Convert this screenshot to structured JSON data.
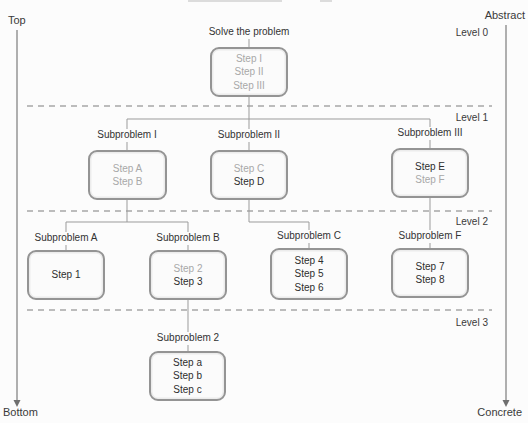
{
  "figure": {
    "width": 528,
    "height": 423,
    "bg": "#fcfcfc"
  },
  "corners": {
    "top_left": "Top",
    "bottom_left": "Bottom",
    "top_right": "Abstract",
    "bottom_right": "Concrete"
  },
  "axes": {
    "left": {
      "x": 17,
      "y1": 30,
      "y2": 401
    },
    "right": {
      "x": 506,
      "y1": 25,
      "y2": 401
    }
  },
  "dashed_lines": [
    {
      "y": 106,
      "x1": 27,
      "x2": 492
    },
    {
      "y": 211,
      "x1": 27,
      "x2": 492
    },
    {
      "y": 310,
      "x1": 27,
      "x2": 492
    }
  ],
  "level_labels": [
    {
      "text": "Level 0",
      "right": 488,
      "top": 27
    },
    {
      "text": "Level 1",
      "right": 488,
      "top": 112
    },
    {
      "text": "Level 2",
      "right": 488,
      "top": 216
    },
    {
      "text": "Level 3",
      "right": 488,
      "top": 317
    }
  ],
  "nodes": [
    {
      "title": "Solve the problem",
      "cx": 249,
      "title_top": 26,
      "box": {
        "x": 210,
        "y": 47,
        "w": 78,
        "h": 50
      },
      "steps": [
        {
          "text": "Step I",
          "muted": true
        },
        {
          "text": "Step II",
          "muted": true
        },
        {
          "text": "Step III",
          "muted": true
        }
      ]
    },
    {
      "title": "Subproblem I",
      "cx": 127,
      "title_top": 129,
      "box": {
        "x": 88,
        "y": 150,
        "w": 79,
        "h": 50
      },
      "steps": [
        {
          "text": "Step A",
          "muted": true
        },
        {
          "text": "Step B",
          "muted": true
        }
      ]
    },
    {
      "title": "Subproblem II",
      "cx": 249,
      "title_top": 129,
      "box": {
        "x": 210,
        "y": 150,
        "w": 78,
        "h": 50
      },
      "steps": [
        {
          "text": "Step C",
          "muted": true
        },
        {
          "text": "Step D",
          "muted": false
        }
      ]
    },
    {
      "title": "Subproblem III",
      "cx": 430,
      "title_top": 127,
      "box": {
        "x": 391,
        "y": 148,
        "w": 78,
        "h": 50
      },
      "steps": [
        {
          "text": "Step E",
          "muted": false
        },
        {
          "text": "Step F",
          "muted": true
        }
      ]
    },
    {
      "title": "Subproblem A",
      "cx": 66,
      "title_top": 232,
      "box": {
        "x": 27,
        "y": 250,
        "w": 78,
        "h": 50
      },
      "steps": [
        {
          "text": "Step 1",
          "muted": false
        }
      ]
    },
    {
      "title": "Subproblem B",
      "cx": 188,
      "title_top": 232,
      "box": {
        "x": 149,
        "y": 250,
        "w": 78,
        "h": 50
      },
      "steps": [
        {
          "text": "Step 2",
          "muted": true
        },
        {
          "text": "Step 3",
          "muted": false
        }
      ]
    },
    {
      "title": "Subproblem C",
      "cx": 309,
      "title_top": 230,
      "box": {
        "x": 270,
        "y": 248,
        "w": 78,
        "h": 52
      },
      "steps": [
        {
          "text": "Step 4",
          "muted": false
        },
        {
          "text": "Step 5",
          "muted": false
        },
        {
          "text": "Step 6",
          "muted": false
        }
      ]
    },
    {
      "title": "Subproblem F",
      "cx": 430,
      "title_top": 230,
      "box": {
        "x": 391,
        "y": 248,
        "w": 78,
        "h": 50
      },
      "steps": [
        {
          "text": "Step 7",
          "muted": false
        },
        {
          "text": "Step 8",
          "muted": false
        }
      ]
    },
    {
      "title": "Subproblem 2",
      "cx": 188,
      "title_top": 332,
      "box": {
        "x": 149,
        "y": 351,
        "w": 77,
        "h": 50
      },
      "steps": [
        {
          "text": "Step a",
          "muted": false
        },
        {
          "text": "Step b",
          "muted": false
        },
        {
          "text": "Step c",
          "muted": false
        }
      ]
    }
  ],
  "connectors": [
    [
      [
        249,
        97
      ],
      [
        249,
        129
      ]
    ],
    [
      [
        127,
        119
      ],
      [
        430,
        119
      ]
    ],
    [
      [
        127,
        119
      ],
      [
        127,
        129
      ]
    ],
    [
      [
        430,
        119
      ],
      [
        430,
        127
      ]
    ],
    [
      [
        127,
        200
      ],
      [
        127,
        222
      ]
    ],
    [
      [
        66,
        222
      ],
      [
        188,
        222
      ]
    ],
    [
      [
        66,
        222
      ],
      [
        66,
        232
      ]
    ],
    [
      [
        188,
        222
      ],
      [
        188,
        232
      ]
    ],
    [
      [
        249,
        200
      ],
      [
        249,
        222
      ],
      [
        309,
        222
      ],
      [
        309,
        230
      ]
    ],
    [
      [
        430,
        198
      ],
      [
        430,
        230
      ]
    ],
    [
      [
        188,
        300
      ],
      [
        188,
        332
      ]
    ]
  ],
  "artifacts": [
    {
      "x": 188,
      "y": 0,
      "w": 94,
      "h": 2
    },
    {
      "x": 320,
      "y": 0,
      "w": 12,
      "h": 2
    }
  ],
  "colors": {
    "connector": "#9b9b9b",
    "dashed_divider": "#7d7d7d",
    "axis_line": "#6f6f6f",
    "box_border": "#949494",
    "box_fill": "#fbfbfb",
    "step_dark": "#2e2e2e",
    "step_muted": "#a8a8a8",
    "label_text": "#3a3a3a"
  }
}
